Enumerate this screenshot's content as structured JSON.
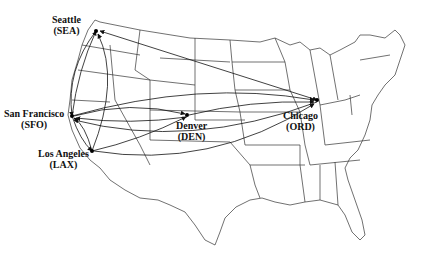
{
  "airports": [
    {
      "city": "Seattle",
      "code": "(SEA)",
      "x": 96,
      "y": 31
    },
    {
      "city": "San Francisco",
      "code": "(SFO)",
      "x": 72,
      "y": 116
    },
    {
      "city": "Los Angeles",
      "code": "(LAX)",
      "x": 92,
      "y": 151
    },
    {
      "city": "Denver",
      "code": "(DEN)",
      "x": 187,
      "y": 115
    },
    {
      "city": "Chicago",
      "code": "(ORD)",
      "x": 317,
      "y": 100
    }
  ],
  "routes": [
    {
      "from": "SFO",
      "to": "SEA"
    },
    {
      "from": "SEA",
      "to": "SFO"
    },
    {
      "from": "LAX",
      "to": "SEA"
    },
    {
      "from": "SEA",
      "to": "ORD"
    },
    {
      "from": "SFO",
      "to": "LAX"
    },
    {
      "from": "LAX",
      "to": "SFO"
    },
    {
      "from": "SFO",
      "to": "DEN"
    },
    {
      "from": "DEN",
      "to": "SFO"
    },
    {
      "from": "LAX",
      "to": "DEN"
    },
    {
      "from": "SFO",
      "to": "ORD"
    },
    {
      "from": "ORD",
      "to": "SFO"
    },
    {
      "from": "DEN",
      "to": "ORD"
    },
    {
      "from": "LAX",
      "to": "ORD"
    }
  ],
  "colors": {
    "line": "#111111",
    "background": "#ffffff"
  }
}
